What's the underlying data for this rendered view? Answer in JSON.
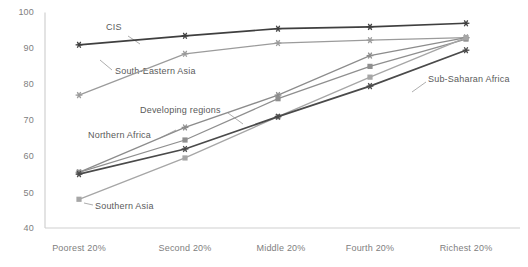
{
  "chart_data": {
    "type": "line",
    "title": "",
    "xlabel": "",
    "ylabel": "",
    "ylim": [
      40,
      100
    ],
    "yticks": [
      40,
      50,
      60,
      70,
      80,
      90,
      100
    ],
    "grid": false,
    "legend_position": "inline-annotations",
    "categories": [
      "Poorest 20%",
      "Second 20%",
      "Middle 20%",
      "Fourth 20%",
      "Richest 20%"
    ],
    "series": [
      {
        "name": "CIS",
        "values": [
          91.0,
          93.5,
          95.5,
          96.0,
          97.0
        ],
        "color": "#3f3f3f",
        "marker": "asterisk"
      },
      {
        "name": "South-Eastern Asia",
        "values": [
          77.0,
          88.5,
          91.5,
          92.3,
          93.0
        ],
        "color": "#9b9b9b",
        "marker": "asterisk"
      },
      {
        "name": "Northern Africa",
        "values": [
          55.5,
          68.0,
          77.0,
          88.0,
          93.0
        ],
        "color": "#8c8c8c",
        "marker": "asterisk"
      },
      {
        "name": "Developing regions",
        "values": [
          55.5,
          64.5,
          76.0,
          85.0,
          92.6
        ],
        "color": "#8f8f8f",
        "marker": "square"
      },
      {
        "name": "Southern Asia",
        "values": [
          48.0,
          59.5,
          71.0,
          82.0,
          93.0
        ],
        "color": "#a6a6a6",
        "marker": "square"
      },
      {
        "name": "Sub-Saharan Africa",
        "values": [
          55.0,
          62.0,
          71.0,
          79.5,
          89.5
        ],
        "color": "#4a4a4a",
        "marker": "asterisk"
      }
    ],
    "annotations": [
      {
        "label": "CIS",
        "x": 106,
        "y": 28,
        "leader": [
          [
            128,
            36
          ],
          [
            140,
            44
          ]
        ]
      },
      {
        "label": "South-Eastern Asia",
        "x": 115,
        "y": 72,
        "leader": [
          [
            112,
            70
          ],
          [
            100,
            60
          ]
        ]
      },
      {
        "label": "Developing regions",
        "x": 140,
        "y": 111,
        "leader": [
          [
            228,
            113
          ],
          [
            243,
            124
          ]
        ]
      },
      {
        "label": "Northern Africa",
        "x": 88,
        "y": 136,
        "leader": [
          [
            160,
            138
          ],
          [
            176,
            130
          ]
        ]
      },
      {
        "label": "Southern Asia",
        "x": 95,
        "y": 207,
        "leader": [
          [
            93,
            205
          ],
          [
            84,
            203
          ]
        ]
      },
      {
        "label": "Sub-Saharan Africa",
        "x": 428,
        "y": 80,
        "leader": [
          [
            426,
            82
          ],
          [
            412,
            92
          ]
        ]
      }
    ],
    "axis_color": "#d0d0d0",
    "tick_label_color": "#808080"
  }
}
